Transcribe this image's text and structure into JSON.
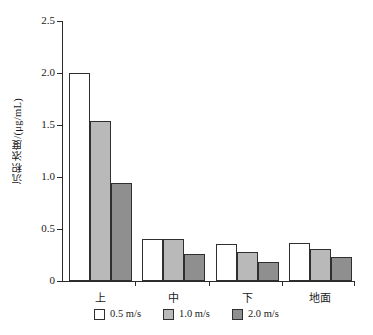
{
  "chart_data": {
    "type": "bar",
    "title": "",
    "xlabel": "",
    "ylabel": "沉积浓度/(μg/mL)",
    "categories": [
      "上",
      "中",
      "下",
      "地面"
    ],
    "series": [
      {
        "name": "0.5 m/s",
        "color": "#ffffff",
        "values": [
          2.0,
          0.4,
          0.36,
          0.37
        ]
      },
      {
        "name": "1.0 m/s",
        "color": "#b9b9b9",
        "values": [
          1.54,
          0.4,
          0.28,
          0.31
        ]
      },
      {
        "name": "2.0 m/s",
        "color": "#8f8f8f",
        "values": [
          0.94,
          0.26,
          0.18,
          0.23
        ]
      }
    ],
    "ylim": [
      0,
      2.5
    ],
    "yticks": [
      0,
      0.5,
      1.0,
      1.5,
      2.0,
      2.5
    ],
    "ytick_labels": [
      "0",
      "0.5",
      "1.0",
      "1.5",
      "2.0",
      "2.5"
    ],
    "grid": false,
    "legend_position": "bottom",
    "bar_edge_color": "#2f2f2f",
    "axis_color": "#2a2a2a"
  }
}
